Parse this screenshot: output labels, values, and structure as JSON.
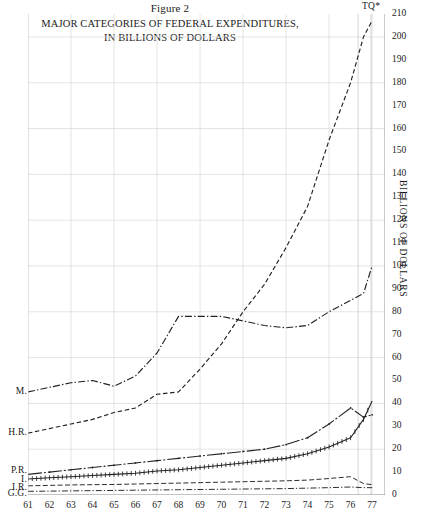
{
  "figure": {
    "number": "Figure 2",
    "title_line1": "MAJOR CATEGORIES OF FEDERAL EXPENDITURES,",
    "title_line2": "IN BILLIONS OF DOLLARS",
    "tq_marker": "TQ*"
  },
  "axes": {
    "y_title": "BILLIONS OF DOLLARS",
    "y_ticks": [
      "0",
      "10",
      "20",
      "30",
      "40",
      "50",
      "60",
      "70",
      "80",
      "90",
      "100",
      "110",
      "120",
      "130",
      "140",
      "150",
      "160",
      "170",
      "180",
      "190",
      "200",
      "210"
    ],
    "x_ticks": [
      "61",
      "62",
      "63",
      "64",
      "65",
      "66",
      "67",
      "68",
      "69",
      "70",
      "71",
      "72",
      "73",
      "74",
      "75",
      "76",
      "77"
    ]
  },
  "series_labels": [
    {
      "key": "M",
      "label": "M."
    },
    {
      "key": "HR",
      "label": "H.R."
    },
    {
      "key": "PR",
      "label": "P.R."
    },
    {
      "key": "I",
      "label": "I."
    },
    {
      "key": "IR",
      "label": "I.R."
    },
    {
      "key": "GG",
      "label": "G.G."
    }
  ],
  "chart_data": {
    "type": "line",
    "title": "MAJOR CATEGORIES OF FEDERAL EXPENDITURES, IN BILLIONS OF DOLLARS",
    "subtitle": "Figure 2",
    "xlabel": "",
    "ylabel": "BILLIONS OF DOLLARS",
    "xlim": [
      61,
      77.6
    ],
    "ylim": [
      0,
      210
    ],
    "grid": true,
    "legend_position": "left-inline",
    "annotations": [
      {
        "text": "TQ*",
        "x": 76.6,
        "note": "transition quarter band between 1976 and 1977"
      }
    ],
    "x": [
      61,
      62,
      63,
      64,
      65,
      66,
      67,
      68,
      69,
      70,
      71,
      72,
      73,
      74,
      75,
      76,
      76.6,
      77
    ],
    "series": [
      {
        "name": "M.",
        "full_name": "Military",
        "style": "dash-dot",
        "values": [
          45,
          47,
          49,
          50,
          47.5,
          52,
          62,
          78,
          78,
          78,
          76,
          74,
          73,
          74,
          80,
          85,
          88,
          100
        ]
      },
      {
        "name": "H.R.",
        "full_name": "Human Resources",
        "style": "dashed",
        "values": [
          27,
          29,
          31,
          33,
          36,
          38,
          44,
          45,
          55,
          66,
          80,
          92,
          108,
          126,
          155,
          180,
          200,
          207
        ]
      },
      {
        "name": "P.R.",
        "full_name": "Physical Resources",
        "style": "solid-dot",
        "values": [
          9,
          10,
          11,
          12,
          13,
          14,
          15,
          16,
          17,
          18,
          19,
          20,
          22,
          25,
          31,
          38,
          34,
          35
        ]
      },
      {
        "name": "I.",
        "full_name": "Interest",
        "style": "cross-hatch",
        "values": [
          7,
          7.5,
          8,
          8.5,
          9,
          9.5,
          10.5,
          11,
          12,
          13,
          14,
          15,
          16,
          18,
          21,
          25,
          33,
          41
        ]
      },
      {
        "name": "I.R.",
        "full_name": "Income Reserves",
        "style": "dashed-thin",
        "values": [
          4,
          4.2,
          4.4,
          4.5,
          4.6,
          4.8,
          5,
          5.2,
          5.4,
          5.6,
          5.8,
          6,
          6.2,
          6.5,
          7.2,
          8,
          5,
          4.5
        ]
      },
      {
        "name": "G.G.",
        "full_name": "General Government",
        "style": "dash-dot-thin",
        "values": [
          1.6,
          1.7,
          1.8,
          1.9,
          2,
          2.1,
          2.2,
          2.3,
          2.4,
          2.5,
          2.6,
          2.7,
          2.8,
          3,
          3.2,
          3.5,
          3.2,
          3.2
        ]
      }
    ]
  }
}
